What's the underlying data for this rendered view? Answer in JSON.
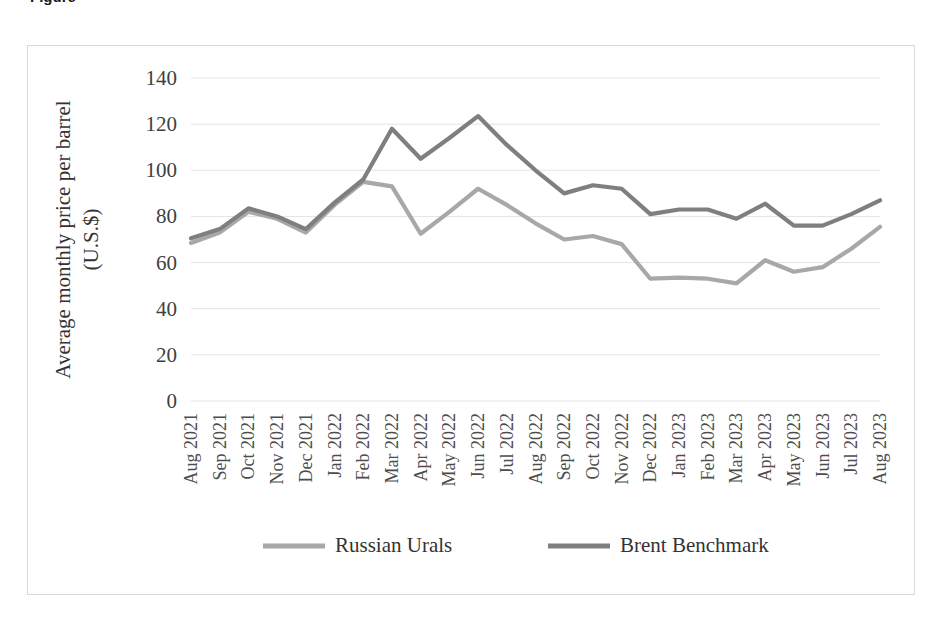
{
  "figure": {
    "caption_fragment": "Figure"
  },
  "chart_data": {
    "type": "line",
    "title": "",
    "xlabel": "",
    "ylabel": "Average monthly price per barrel (U.S.$)",
    "ylabel_line1": "Average monthly price per barrel",
    "ylabel_line2": "(U.S.$)",
    "ylim": [
      0,
      140
    ],
    "ytick_step": 20,
    "yticks": [
      "0",
      "20",
      "40",
      "60",
      "80",
      "100",
      "120",
      "140"
    ],
    "grid": true,
    "grid_axis": "y",
    "legend_position": "bottom",
    "categories": [
      "Aug 2021",
      "Sep 2021",
      "Oct 2021",
      "Nov 2021",
      "Dec 2021",
      "Jan 2022",
      "Feb 2022",
      "Mar 2022",
      "Apr 2022",
      "May 2022",
      "Jun 2022",
      "Jul 2022",
      "Aug 2022",
      "Sep 2022",
      "Oct 2022",
      "Nov 2022",
      "Dec 2022",
      "Jan 2023",
      "Feb 2023",
      "Mar 2023",
      "Apr 2023",
      "May 2023",
      "Jun 2023",
      "Jul 2023",
      "Aug 2023"
    ],
    "series": [
      {
        "name": "Russian Urals",
        "color": "#a8a8a8",
        "values": [
          68.5,
          73.0,
          82.0,
          79.0,
          73.0,
          85.0,
          95.0,
          93.0,
          72.5,
          82.0,
          92.0,
          85.0,
          77.0,
          70.0,
          71.5,
          68.0,
          53.0,
          53.5,
          53.0,
          51.0,
          61.0,
          56.0,
          58.0,
          66.0,
          75.5
        ]
      },
      {
        "name": "Brent Benchmark",
        "color": "#7f7f7f",
        "values": [
          70.5,
          74.5,
          83.5,
          80.0,
          74.5,
          86.0,
          96.0,
          118.0,
          105.0,
          114.0,
          123.5,
          111.0,
          100.0,
          90.0,
          93.5,
          92.0,
          81.0,
          83.0,
          83.0,
          79.0,
          85.5,
          76.0,
          76.0,
          81.0,
          87.0
        ]
      }
    ]
  },
  "legend": {
    "items": [
      {
        "label": "Russian Urals",
        "color": "#a8a8a8"
      },
      {
        "label": "Brent Benchmark",
        "color": "#7f7f7f"
      }
    ]
  }
}
